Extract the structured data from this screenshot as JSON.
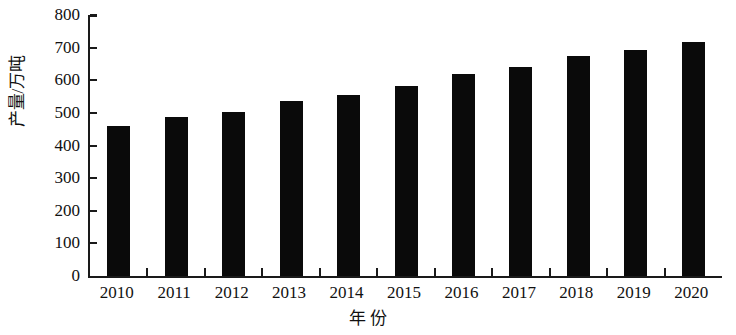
{
  "chart_data": {
    "type": "bar",
    "title": "",
    "subtitle": "",
    "xlabel": "年 份",
    "ylabel": "产量/万吨",
    "categories": [
      "2010",
      "2011",
      "2012",
      "2013",
      "2014",
      "2015",
      "2016",
      "2017",
      "2018",
      "2019",
      "2020"
    ],
    "values": [
      460,
      487,
      503,
      535,
      555,
      583,
      620,
      640,
      673,
      693,
      718
    ],
    "series": [
      {
        "name": "产量",
        "values": [
          460,
          487,
          503,
          535,
          555,
          583,
          620,
          640,
          673,
          693,
          718
        ]
      }
    ],
    "ylim": [
      0,
      800
    ],
    "ytick_values": [
      0,
      100,
      200,
      300,
      400,
      500,
      600,
      700,
      800
    ],
    "ytick_labels": [
      "0",
      "100",
      "200",
      "300",
      "400",
      "500",
      "600",
      "700",
      "800"
    ],
    "xtick_labels": [
      "2010",
      "2011",
      "2012",
      "2013",
      "2014",
      "2015",
      "2016",
      "2017",
      "2018",
      "2019",
      "2020"
    ],
    "grid": false,
    "legend": null,
    "legend_position": "none",
    "bar_color": "#0a0a0a",
    "axis_color": "#1a1a1a",
    "background_color": "#ffffff",
    "annotations": []
  }
}
